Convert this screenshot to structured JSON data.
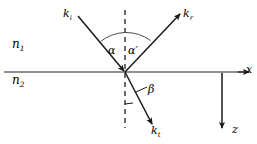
{
  "figure": {
    "kind": "optics-ray-diagram",
    "colors": {
      "ink": "#1a1a1a",
      "interface_line": "#6b6b6b",
      "ray_line": "#1a1a1a",
      "normal_dashed": "#4d4d4d",
      "arc": "#4d4d4d",
      "background": "#ffffff"
    }
  },
  "media": {
    "upper_label": "n",
    "upper_subscript": "1",
    "lower_label": "n",
    "lower_subscript": "2"
  },
  "rays": {
    "incident": {
      "label": "k",
      "subscript": "i",
      "direction": "down-right toward origin"
    },
    "reflected": {
      "label": "k",
      "subscript": "r",
      "direction": "up-right away from origin"
    },
    "transmitted": {
      "label": "k",
      "subscript": "t",
      "direction": "down-right away from origin"
    }
  },
  "angles": {
    "incidence": "α",
    "reflection": "α",
    "reflection_prime": "′",
    "refraction": "β"
  },
  "axes": {
    "horizontal": "x",
    "vertical": "z"
  },
  "geometry": {
    "origin_x": 125,
    "origin_y": 72,
    "interface_y": 72,
    "normal_x": 125,
    "normal_top_y": 10,
    "normal_bottom_y": 128,
    "incident_start_x": 78,
    "incident_start_y": 16,
    "reflected_end_x": 181,
    "reflected_end_y": 13,
    "transmitted_end_x": 153,
    "transmitted_end_y": 126,
    "x_axis_end_x": 250,
    "z_axis_x": 222,
    "z_axis_end_y": 129
  }
}
